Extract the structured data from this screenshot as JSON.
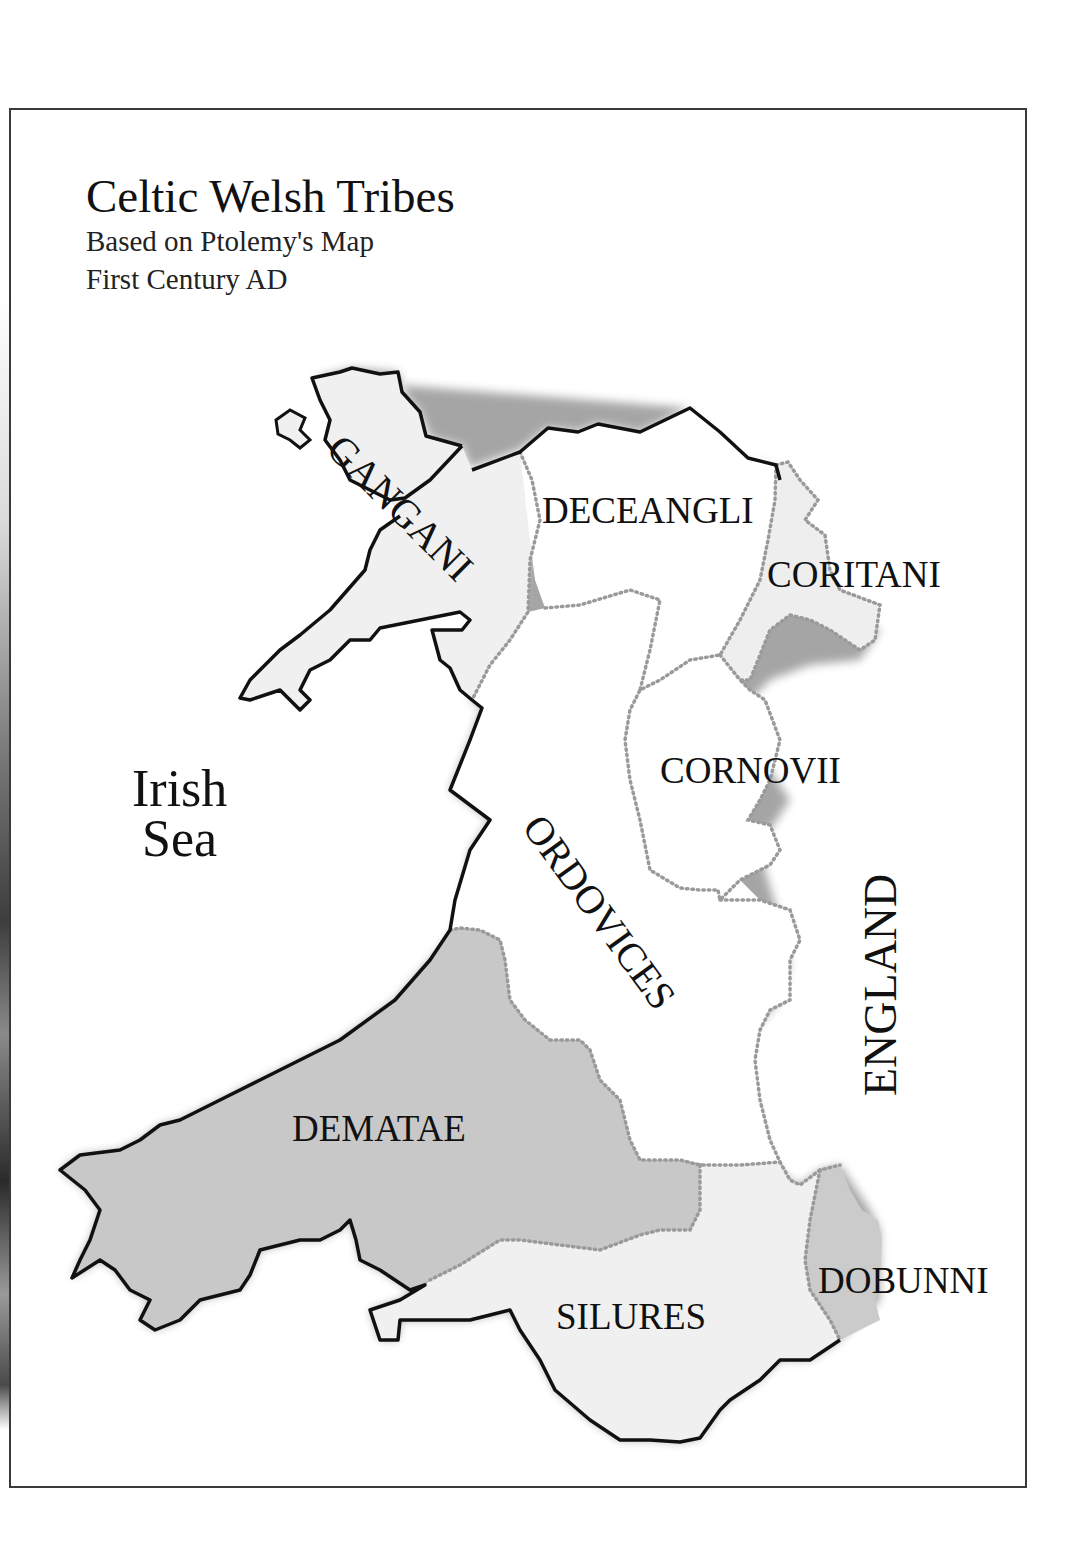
{
  "title": {
    "main": "Celtic Welsh Tribes",
    "line1": "Based on Ptolemy's Map",
    "line2": "First Century AD"
  },
  "water": {
    "sea_line1": "Irish",
    "sea_line2": "Sea"
  },
  "neighbour": {
    "label": "ENGLAND"
  },
  "tribes": [
    {
      "name": "GANGANI",
      "fill": "#f0f0f0"
    },
    {
      "name": "DECEANGLI",
      "fill": "#ffffff"
    },
    {
      "name": "CORITANI",
      "fill": "#eeeeee"
    },
    {
      "name": "CORNOVII",
      "fill": "#ffffff"
    },
    {
      "name": "ORDOVICES",
      "fill": "#ffffff"
    },
    {
      "name": "DEMATAE",
      "fill": "#c8c8c8"
    },
    {
      "name": "SILURES",
      "fill": "#f0f0f0"
    },
    {
      "name": "DOBUNNI",
      "fill": "#cbcbcb"
    }
  ],
  "colors": {
    "coastline": "#111111",
    "tribal_border": "#9a9a9a",
    "frame": "#3a3a3a"
  }
}
